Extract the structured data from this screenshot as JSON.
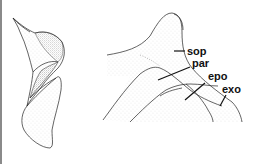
{
  "figure": {
    "left_panel": {
      "description": "lateral view of sclerite, stippled shading"
    },
    "right_panel": {
      "labels": [
        {
          "id": "sop",
          "text": "sop"
        },
        {
          "id": "par",
          "text": "par"
        },
        {
          "id": "epo",
          "text": "epo"
        },
        {
          "id": "exo",
          "text": "exo"
        }
      ]
    }
  },
  "colors": {
    "line": "#222222",
    "stipple": "#9a9a9a",
    "border": "#8a8a8a"
  }
}
